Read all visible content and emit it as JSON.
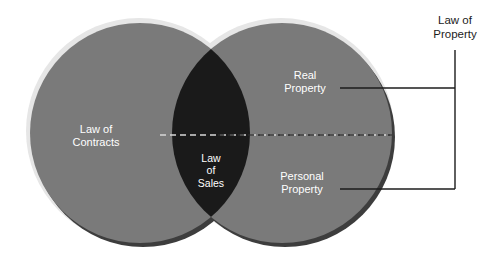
{
  "diagram": {
    "type": "venn",
    "background_color": "#ffffff",
    "circle_fill": "#7a7a7a",
    "intersection_fill": "#1a1a1a",
    "halo_color": "#e3e3e3",
    "shadow_color": "#3a3a3a",
    "line_color": "#1c1c1c",
    "label_color_on_fill": "#ffffff",
    "label_color_outside": "#1c1c1c",
    "sets": [
      {
        "id": "left-circle",
        "label": "Law of\nContracts",
        "cx": 140,
        "cy": 133,
        "r": 110,
        "fill": "#7a7a7a"
      },
      {
        "id": "right-circle",
        "label": "Law of\nProperty",
        "cx": 282,
        "cy": 133,
        "r": 110,
        "fill": "#7a7a7a"
      }
    ],
    "intersection": {
      "id": "intersection-lens",
      "label": "Law\nof\nSales",
      "fill": "#1a1a1a"
    },
    "subdivisions": [
      {
        "id": "real-property",
        "label": "Real\nProperty"
      },
      {
        "id": "personal-property",
        "label": "Personal\nProperty"
      }
    ],
    "divider": {
      "id": "dashed-divider",
      "style": "dashed",
      "x1": 160,
      "x2": 392,
      "y": 135
    },
    "bracket": {
      "id": "law-of-property-bracket",
      "label": "Law of\nProperty",
      "top_line_y": 88,
      "bottom_line_y": 189,
      "left_x": 340,
      "right_x": 455,
      "vertical_top_y": 50
    }
  },
  "labels": {
    "law_of_contracts": "Law of\nContracts",
    "law_of_sales": "Law\nof\nSales",
    "real_property": "Real\nProperty",
    "personal_property": "Personal\nProperty",
    "law_of_property": "Law of\nProperty"
  }
}
